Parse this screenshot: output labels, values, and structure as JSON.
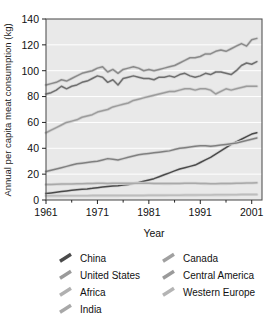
{
  "chart_data": {
    "type": "line",
    "title": "",
    "xlabel": "Year",
    "ylabel": "Annual per capita meat consumption (kg)",
    "xlim": [
      1961,
      2003
    ],
    "ylim": [
      0,
      140
    ],
    "yticks": [
      0,
      20,
      40,
      60,
      80,
      100,
      120,
      140
    ],
    "xticks": [
      1961,
      1971,
      1981,
      1991,
      2001
    ],
    "xminorticks": [
      1966,
      1976,
      1986,
      1996
    ],
    "grid": "horizontal-white",
    "legend_position": "below-plot-two-columns",
    "x": [
      1961,
      1962,
      1963,
      1964,
      1965,
      1966,
      1967,
      1968,
      1969,
      1970,
      1971,
      1972,
      1973,
      1974,
      1975,
      1976,
      1977,
      1978,
      1979,
      1980,
      1981,
      1982,
      1983,
      1984,
      1985,
      1986,
      1987,
      1988,
      1989,
      1990,
      1991,
      1992,
      1993,
      1994,
      1995,
      1996,
      1997,
      1998,
      1999,
      2000,
      2001,
      2002
    ],
    "series": [
      {
        "name": "China",
        "color": "#4a4a4a",
        "values": [
          5,
          5.5,
          6,
          6.5,
          7,
          7.5,
          8,
          8.3,
          8.6,
          9,
          9.5,
          10,
          10.5,
          10.8,
          11,
          11.5,
          12,
          12.8,
          13.5,
          14.5,
          15.5,
          16.5,
          18,
          19.5,
          21,
          22.5,
          24,
          25,
          26,
          27,
          29,
          31,
          33,
          35.5,
          38,
          40.5,
          43,
          45,
          47,
          49,
          51,
          52
        ]
      },
      {
        "name": "United States",
        "color": "#6e6e6e",
        "values": [
          82,
          83,
          85,
          88,
          86,
          88,
          89,
          91,
          92,
          94,
          96,
          95,
          91,
          93,
          89,
          94,
          95,
          96,
          95,
          94,
          94,
          93,
          95,
          95,
          96,
          95,
          97,
          98,
          96,
          95,
          96,
          98,
          97,
          99,
          99,
          98,
          97,
          100,
          104,
          106,
          105,
          107
        ]
      },
      {
        "name": "Africa",
        "color": "#a9a9a9",
        "values": [
          12,
          12,
          12.2,
          12.3,
          12.4,
          12.4,
          12.5,
          12.6,
          12.7,
          12.8,
          12.9,
          12.9,
          12.8,
          12.9,
          12.9,
          13,
          13,
          13,
          12.9,
          12.9,
          12.9,
          12.8,
          12.8,
          12.7,
          12.7,
          12.8,
          12.8,
          12.9,
          12.9,
          12.9,
          12.8,
          12.7,
          12.6,
          12.6,
          12.7,
          12.7,
          12.8,
          12.9,
          13,
          13.1,
          13.2,
          13.3
        ]
      },
      {
        "name": "India",
        "color": "#bdbdbd",
        "values": [
          3.2,
          3.2,
          3.2,
          3.2,
          3.3,
          3.3,
          3.3,
          3.3,
          3.3,
          3.4,
          3.4,
          3.4,
          3.4,
          3.4,
          3.4,
          3.5,
          3.5,
          3.5,
          3.5,
          3.5,
          3.6,
          3.6,
          3.6,
          3.6,
          3.7,
          3.7,
          3.7,
          3.8,
          3.8,
          3.8,
          3.9,
          3.9,
          3.9,
          4,
          4,
          4,
          4.1,
          4.1,
          4.2,
          4.2,
          4.3,
          4.3
        ]
      },
      {
        "name": "Canada",
        "color": "#8a8a8a",
        "values": [
          89,
          90,
          91,
          93,
          92,
          94,
          96,
          98,
          99,
          100,
          102,
          103,
          99,
          101,
          98,
          101,
          102,
          103,
          102,
          100,
          101,
          100,
          101,
          102,
          103,
          104,
          106,
          108,
          110,
          110,
          111,
          113,
          113,
          115,
          116,
          115,
          117,
          119,
          121,
          119,
          124,
          125
        ]
      },
      {
        "name": "Central America",
        "color": "#808080",
        "values": [
          22,
          23,
          24,
          25,
          26,
          27,
          28,
          28.5,
          29,
          29.5,
          30,
          31,
          32,
          31.5,
          31,
          32,
          33,
          34,
          35,
          35.5,
          36,
          36.5,
          37,
          37.5,
          38,
          39,
          40,
          40.5,
          41,
          41.5,
          42,
          42,
          41.5,
          42,
          42.5,
          43,
          43.5,
          44,
          45,
          46,
          47,
          48
        ]
      },
      {
        "name": "Western Europe",
        "color": "#9c9c9c",
        "values": [
          52,
          54,
          56,
          58,
          60,
          61,
          62,
          64,
          65,
          66,
          68,
          69,
          70,
          72,
          73,
          74,
          75,
          77,
          78,
          79,
          80,
          81,
          82,
          83,
          84,
          84,
          85,
          86,
          86,
          85,
          86,
          86,
          85,
          82,
          84,
          86,
          85,
          86,
          87,
          88,
          88,
          88
        ]
      }
    ]
  },
  "axes": {
    "y_tick_labels": [
      "0",
      "20",
      "40",
      "60",
      "80",
      "100",
      "120",
      "140"
    ],
    "x_tick_labels": [
      "1961",
      "1971",
      "1981",
      "1991",
      "2001"
    ],
    "y_axis_title": "Annual per capita meat consumption (kg)",
    "x_axis_title": "Year"
  },
  "legend": {
    "columns": [
      {
        "items": [
          {
            "label": "China",
            "color": "#4a4a4a"
          },
          {
            "label": "United States",
            "color": "#9a9a9a"
          },
          {
            "label": "Africa",
            "color": "#b0b0b0"
          },
          {
            "label": "India",
            "color": "#a8a8a8"
          }
        ]
      },
      {
        "items": [
          {
            "label": "Canada",
            "color": "#a0a0a0"
          },
          {
            "label": "Central America",
            "color": "#9a9a9a"
          },
          {
            "label": "Western Europe",
            "color": "#b4b4b4"
          }
        ]
      }
    ]
  }
}
